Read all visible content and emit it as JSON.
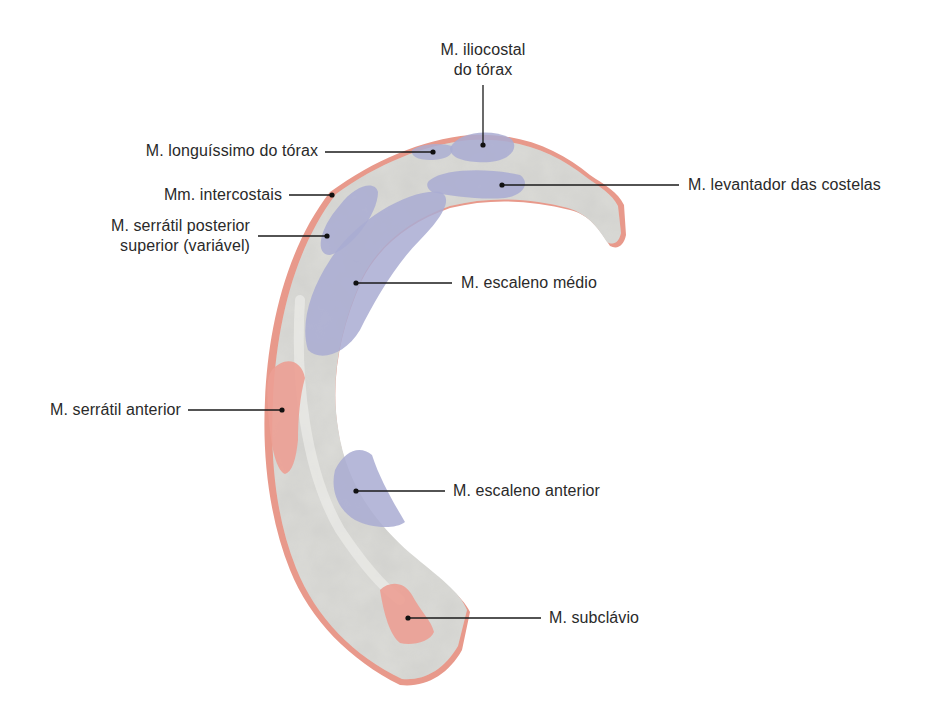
{
  "figure": {
    "colors": {
      "bone_fill": "#dcdcd8",
      "bone_shadow": "#c4c4c0",
      "origin_blue": "#a9acd2",
      "insertion_red": "#ec9f93",
      "edge_red": "#e59486",
      "leader_line": "#1a1a1a",
      "text": "#2a2a2a"
    },
    "labels": [
      {
        "id": "iliocostal",
        "line1": "M. iliocostal",
        "line2": "do tórax"
      },
      {
        "id": "longuissimo",
        "text": "M. longuíssimo do tórax"
      },
      {
        "id": "levantador",
        "text": "M. levantador das costelas"
      },
      {
        "id": "intercostais",
        "text": "Mm. intercostais"
      },
      {
        "id": "serratil_posterior",
        "line1": "M. serrátil posterior",
        "line2": "superior (variável)"
      },
      {
        "id": "escaleno_medio",
        "text": "M. escaleno médio"
      },
      {
        "id": "serratil_anterior",
        "text": "M. serrátil anterior"
      },
      {
        "id": "escaleno_anterior",
        "text": "M. escaleno anterior"
      },
      {
        "id": "subclavio",
        "text": "M. subclávio"
      }
    ]
  }
}
